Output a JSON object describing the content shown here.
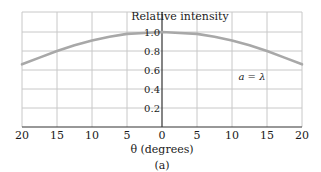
{
  "chart_data": {
    "type": "line",
    "title": "Relative intensity",
    "xlabel": "θ (degrees)",
    "ylabel": "Relative intensity",
    "subcaption": "(a)",
    "annotation": "a = λ",
    "xlim": [
      -20,
      20
    ],
    "ylim": [
      0,
      1.0
    ],
    "x_ticks": [
      -20,
      -15,
      -10,
      -5,
      0,
      5,
      10,
      15,
      20
    ],
    "x_tick_labels": [
      "20",
      "15",
      "10",
      "5",
      "0",
      "5",
      "10",
      "15",
      "20"
    ],
    "y_ticks": [
      0.2,
      0.4,
      0.6,
      0.8,
      1.0
    ],
    "y_tick_labels": [
      "0.2",
      "0.4",
      "0.6",
      "0.8",
      "1.0"
    ],
    "grid": true,
    "series": [
      {
        "name": "a = λ",
        "color": "#a8a8a8",
        "x": [
          -20,
          -17.5,
          -15,
          -12.5,
          -10,
          -7.5,
          -5,
          -2.5,
          0,
          2.5,
          5,
          7.5,
          10,
          12.5,
          15,
          17.5,
          20
        ],
        "y": [
          0.66,
          0.73,
          0.8,
          0.86,
          0.91,
          0.95,
          0.98,
          0.99,
          1.0,
          0.99,
          0.98,
          0.95,
          0.91,
          0.86,
          0.8,
          0.73,
          0.66
        ]
      }
    ]
  },
  "colors": {
    "grid": "#c8c8c8",
    "axis": "#333333",
    "curve": "#a8a8a8"
  }
}
